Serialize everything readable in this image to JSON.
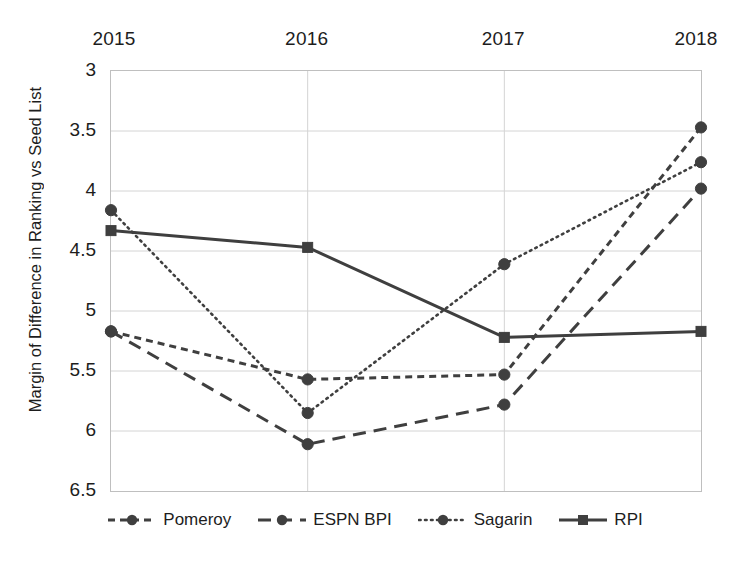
{
  "chart_data": {
    "type": "line",
    "title": "",
    "xlabel": "",
    "ylabel": "Margin of Difference in Ranking vs Seed List",
    "categories": [
      "2015",
      "2016",
      "2017",
      "2018"
    ],
    "x_axis_position": "top",
    "y_inverted": true,
    "ylim": [
      3,
      6.5
    ],
    "yticks": [
      "3",
      "3.5",
      "4",
      "4.5",
      "5",
      "5.5",
      "6",
      "6.5"
    ],
    "ytick_values": [
      3,
      3.5,
      4,
      4.5,
      5,
      5.5,
      6,
      6.5
    ],
    "grid": "horizontal-and-category",
    "legend_position": "bottom",
    "series": [
      {
        "name": "Pomeroy",
        "values": [
          5.17,
          5.57,
          5.53,
          3.47
        ],
        "line_style": "short-dash",
        "marker": "circle",
        "color": "#3f3f3f"
      },
      {
        "name": "ESPN BPI",
        "values": [
          5.17,
          6.11,
          5.78,
          3.98
        ],
        "line_style": "long-dash",
        "marker": "circle",
        "color": "#3f3f3f"
      },
      {
        "name": "Sagarin",
        "values": [
          4.16,
          5.85,
          4.61,
          3.76
        ],
        "line_style": "dotted",
        "marker": "circle",
        "color": "#3f3f3f"
      },
      {
        "name": "RPI",
        "values": [
          4.33,
          4.47,
          5.22,
          5.17
        ],
        "line_style": "solid",
        "marker": "square",
        "color": "#3f3f3f"
      }
    ]
  },
  "colors": {
    "series": "#3f3f3f",
    "gridline": "#d4d4d4",
    "axis_border": "#bfbfbf",
    "text": "#1d1d1d",
    "background": "#ffffff"
  }
}
